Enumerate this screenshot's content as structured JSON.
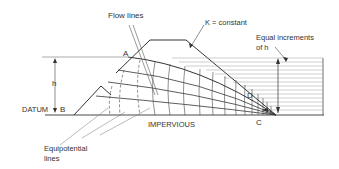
{
  "diagram": {
    "type": "flow net through embankment dam",
    "labels": {
      "flow_lines": "Flow lines",
      "k_constant": "K = constant",
      "equal_increments_line1": "Equal increments",
      "equal_increments_line2": "of  h",
      "point_a": "A",
      "point_b": "B",
      "point_c": "C",
      "point_d": "D",
      "h": "h",
      "datum": "DATUM",
      "impervious": "IMPERVIOUS",
      "equipotential_line1": "Equipotential",
      "equipotential_line2": "lines"
    },
    "colors": {
      "line": "#333333",
      "light_line": "#8a8a8a",
      "background": "#ffffff"
    }
  }
}
